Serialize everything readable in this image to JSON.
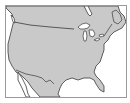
{
  "map": {
    "title": "",
    "region": "North America (United States outline)",
    "colors": {
      "land": "#c9c9c9",
      "water": "#ffffff",
      "outline": "#3a3a3a",
      "frame": "#9a9a9a"
    },
    "features": [
      {
        "name": "canada-us-border"
      },
      {
        "name": "great-lakes"
      },
      {
        "name": "florida"
      },
      {
        "name": "mexico"
      },
      {
        "name": "baja-california"
      },
      {
        "name": "gulf-of-mexico"
      }
    ]
  }
}
